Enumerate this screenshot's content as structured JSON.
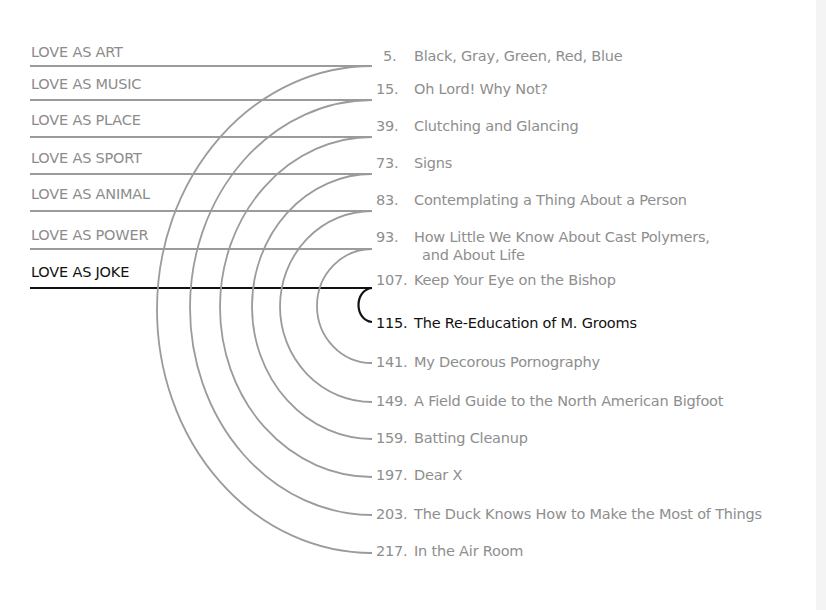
{
  "colors": {
    "line": "#9b9b9b",
    "active_line": "#111111",
    "text": "#8e8e8e",
    "active_text": "#111111"
  },
  "junction_x": 372,
  "categories": [
    {
      "label": "LOVE AS ART",
      "line_y": 66,
      "label_y": 44,
      "active": false
    },
    {
      "label": "LOVE AS MUSIC",
      "line_y": 100,
      "label_y": 76,
      "active": false
    },
    {
      "label": "LOVE AS PLACE",
      "line_y": 137,
      "label_y": 112,
      "active": false
    },
    {
      "label": "LOVE AS SPORT",
      "line_y": 174,
      "label_y": 150,
      "active": false
    },
    {
      "label": "LOVE AS ANIMAL",
      "line_y": 211,
      "label_y": 186,
      "active": false
    },
    {
      "label": "LOVE AS POWER",
      "line_y": 249,
      "label_y": 227,
      "active": false
    },
    {
      "label": "LOVE AS JOKE",
      "line_y": 288,
      "label_y": 264,
      "active": true
    }
  ],
  "stories": [
    {
      "page": "5.",
      "title": "Black, Gray, Green, Red, Blue",
      "x": 383,
      "y": 47,
      "active": false
    },
    {
      "page": "15.",
      "title": "Oh Lord! Why Not?",
      "x": 376,
      "y": 80,
      "active": false
    },
    {
      "page": "39.",
      "title": "Clutching and Glancing",
      "x": 376,
      "y": 117,
      "active": false
    },
    {
      "page": "73.",
      "title": "Signs",
      "x": 376,
      "y": 154,
      "active": false
    },
    {
      "page": "83.",
      "title": "Contemplating a Thing About a Person",
      "x": 376,
      "y": 191,
      "active": false
    },
    {
      "page": "93.",
      "title": "How Little We Know About Cast Polymers,",
      "title_line2": "and About Life",
      "x": 376,
      "y": 228,
      "active": false
    },
    {
      "page": "107.",
      "title": "Keep Your Eye on the Bishop",
      "x": 376,
      "y": 271,
      "active": false
    },
    {
      "page": "115.",
      "title": "The Re-Education of M. Grooms",
      "x": 376,
      "y": 314,
      "active": true
    },
    {
      "page": "141.",
      "title": "My Decorous Pornography",
      "x": 376,
      "y": 353,
      "active": false
    },
    {
      "page": "149.",
      "title": "A Field Guide to the North American Bigfoot",
      "x": 376,
      "y": 392,
      "active": false
    },
    {
      "page": "159.",
      "title": "Batting Cleanup",
      "x": 376,
      "y": 429,
      "active": false
    },
    {
      "page": "197.",
      "title": "Dear X",
      "x": 376,
      "y": 466,
      "active": false
    },
    {
      "page": "203.",
      "title": "The Duck Knows How to Make the Most of Things",
      "x": 376,
      "y": 505,
      "active": false
    },
    {
      "page": "217.",
      "title": "In the Air Room",
      "x": 376,
      "y": 542,
      "active": false
    }
  ],
  "arcs": [
    {
      "from": "LOVE AS ART",
      "to": "217.",
      "y_top": 66,
      "y_bottom": 553,
      "rx": 215
    },
    {
      "from": "LOVE AS MUSIC",
      "to": "203.",
      "y_top": 100,
      "y_bottom": 515,
      "rx": 182
    },
    {
      "from": "LOVE AS PLACE",
      "to": "197.",
      "y_top": 137,
      "y_bottom": 477,
      "rx": 152
    },
    {
      "from": "LOVE AS SPORT",
      "to": "159.",
      "y_top": 174,
      "y_bottom": 439,
      "rx": 120
    },
    {
      "from": "LOVE AS ANIMAL",
      "to": "149.",
      "y_top": 211,
      "y_bottom": 402,
      "rx": 92
    },
    {
      "from": "LOVE AS POWER",
      "to": "141.",
      "y_top": 249,
      "y_bottom": 363,
      "rx": 55
    },
    {
      "from": "LOVE AS JOKE",
      "to": "115.",
      "y_top": 288,
      "y_bottom": 322,
      "rx": 14,
      "active": true
    }
  ]
}
